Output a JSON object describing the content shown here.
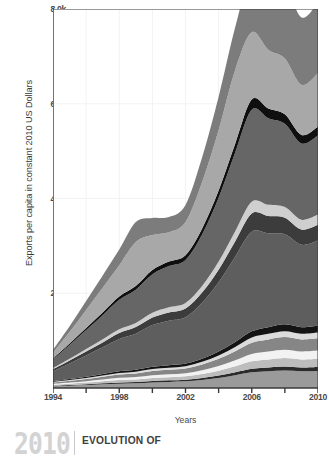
{
  "figure": {
    "background": "#ffffff"
  },
  "footer": {
    "year": "2010",
    "title": "EVOLUTION OF"
  },
  "chart_data": {
    "type": "area",
    "stacked": true,
    "title": "",
    "subtitle": "",
    "xlabel": "Years",
    "ylabel": "Exports per capita in constant 2010 US Dollars",
    "xlim": [
      1994,
      2010
    ],
    "ylim": [
      0,
      8000
    ],
    "xticks": [
      1994,
      1996,
      1998,
      2000,
      2002,
      2004,
      2006,
      2008,
      2010
    ],
    "xtick_labels": [
      "1994",
      "",
      "1998",
      "",
      "2002",
      "",
      "2006",
      "",
      "2010"
    ],
    "yticks": [
      2000,
      4000,
      6000,
      8000
    ],
    "ytick_labels": [
      "2.0k",
      "4.0k",
      "6.0k",
      "8.0k"
    ],
    "grid": true,
    "grid_color": "#f2f2f2",
    "legend": "none",
    "x": [
      1994,
      1995,
      1996,
      1997,
      1998,
      1999,
      2000,
      2001,
      2002,
      2003,
      2004,
      2005,
      2006,
      2007,
      2008,
      2009,
      2010
    ],
    "series": [
      {
        "name": "band-01",
        "color": "#9a9a9a",
        "values": [
          35,
          48,
          62,
          78,
          92,
          100,
          118,
          128,
          140,
          168,
          210,
          268,
          330,
          352,
          368,
          352,
          360
        ]
      },
      {
        "name": "band-02",
        "color": "#2b2b2b",
        "values": [
          12,
          15,
          18,
          22,
          26,
          28,
          32,
          34,
          36,
          42,
          52,
          62,
          74,
          80,
          84,
          80,
          82
        ]
      },
      {
        "name": "band-03",
        "color": "#bdbdbd",
        "values": [
          22,
          28,
          34,
          42,
          50,
          54,
          62,
          66,
          70,
          84,
          104,
          130,
          160,
          172,
          180,
          172,
          176
        ]
      },
      {
        "name": "band-04",
        "color": "#f2f2f2",
        "values": [
          18,
          24,
          30,
          38,
          46,
          50,
          58,
          62,
          66,
          80,
          100,
          126,
          156,
          168,
          176,
          168,
          172
        ]
      },
      {
        "name": "band-05",
        "color": "#868686",
        "values": [
          28,
          36,
          46,
          58,
          70,
          76,
          88,
          94,
          100,
          120,
          150,
          190,
          236,
          254,
          266,
          254,
          260
        ]
      },
      {
        "name": "band-06",
        "color": "#dcdcdc",
        "values": [
          14,
          18,
          22,
          28,
          34,
          36,
          42,
          45,
          48,
          58,
          72,
          90,
          112,
          120,
          126,
          120,
          123
        ]
      },
      {
        "name": "band-07",
        "color": "#141414",
        "values": [
          16,
          20,
          26,
          32,
          38,
          42,
          48,
          52,
          55,
          66,
          82,
          104,
          128,
          138,
          144,
          138,
          141
        ]
      },
      {
        "name": "band-08",
        "color": "#5e5e5e",
        "values": [
          210,
          330,
          450,
          560,
          680,
          760,
          880,
          940,
          980,
          1180,
          1460,
          1800,
          2100,
          1980,
          1900,
          1740,
          1800
        ]
      },
      {
        "name": "band-09",
        "color": "#3c3c3c",
        "values": [
          40,
          60,
          82,
          104,
          126,
          140,
          160,
          172,
          182,
          216,
          268,
          330,
          390,
          368,
          352,
          322,
          334
        ]
      },
      {
        "name": "band-10",
        "color": "#cfcfcf",
        "values": [
          26,
          38,
          52,
          66,
          80,
          88,
          102,
          110,
          116,
          138,
          170,
          210,
          248,
          234,
          224,
          206,
          212
        ]
      },
      {
        "name": "band-11",
        "color": "#666666",
        "values": [
          180,
          290,
          400,
          510,
          620,
          700,
          810,
          870,
          910,
          1090,
          1350,
          1660,
          1940,
          1830,
          1760,
          1610,
          1670
        ]
      },
      {
        "name": "band-12",
        "color": "#0f0f0f",
        "values": [
          22,
          34,
          46,
          58,
          70,
          78,
          90,
          96,
          101,
          121,
          150,
          184,
          216,
          204,
          196,
          179,
          186
        ]
      },
      {
        "name": "band-13",
        "color": "#a8a8a8",
        "values": [
          120,
          240,
          380,
          520,
          660,
          930,
          740,
          620,
          700,
          980,
          1280,
          1560,
          1420,
          1240,
          1180,
          1060,
          1130
        ]
      },
      {
        "name": "band-14",
        "color": "#7c7c7c",
        "values": [
          60,
          120,
          190,
          260,
          330,
          420,
          360,
          320,
          360,
          520,
          700,
          900,
          1260,
          1450,
          1560,
          1420,
          1490
        ]
      }
    ]
  }
}
